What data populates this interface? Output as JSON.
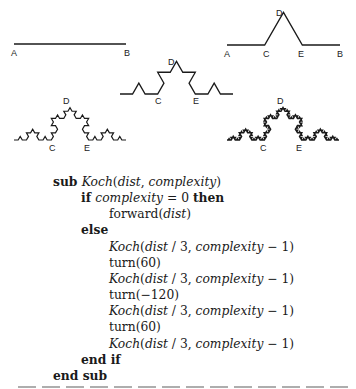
{
  "figures": [
    {
      "level": 0,
      "start": [
        14,
        44
      ],
      "end": [
        126,
        44
      ],
      "labels": [
        {
          "t": "A",
          "x": 11,
          "y": 56
        },
        {
          "t": "B",
          "x": 124,
          "y": 56
        }
      ]
    },
    {
      "level": 1,
      "start": [
        227,
        45
      ],
      "end": [
        340,
        45
      ],
      "labels": [
        {
          "t": "A",
          "x": 224,
          "y": 57
        },
        {
          "t": "C",
          "x": 263,
          "y": 57
        },
        {
          "t": "D",
          "x": 276,
          "y": 16
        },
        {
          "t": "E",
          "x": 298,
          "y": 57
        },
        {
          "t": "B",
          "x": 337,
          "y": 57
        }
      ]
    },
    {
      "level": 2,
      "start": [
        120,
        94
      ],
      "end": [
        233,
        94
      ],
      "labels": [
        {
          "t": "D",
          "x": 168,
          "y": 65
        },
        {
          "t": "C",
          "x": 155,
          "y": 104
        },
        {
          "t": "E",
          "x": 193,
          "y": 104
        }
      ]
    },
    {
      "level": 3,
      "start": [
        14,
        140
      ],
      "end": [
        126,
        140
      ],
      "labels": [
        {
          "t": "D",
          "x": 63,
          "y": 104
        },
        {
          "t": "C",
          "x": 49,
          "y": 151
        },
        {
          "t": "E",
          "x": 84,
          "y": 151
        }
      ]
    },
    {
      "level": 4,
      "start": [
        227,
        140
      ],
      "end": [
        339,
        140
      ],
      "labels": [
        {
          "t": "D",
          "x": 277,
          "y": 104
        },
        {
          "t": "C",
          "x": 260,
          "y": 151
        },
        {
          "t": "E",
          "x": 296,
          "y": 151
        }
      ]
    }
  ],
  "code": {
    "lines": [
      {
        "indent": 53,
        "parts": [
          {
            "k": "kw",
            "t": "sub "
          },
          {
            "k": "it",
            "t": "Koch"
          },
          {
            "k": "rm",
            "t": "("
          },
          {
            "k": "it",
            "t": "dist"
          },
          {
            "k": "rm",
            "t": ", "
          },
          {
            "k": "it",
            "t": "complexity"
          },
          {
            "k": "rm",
            "t": ")"
          }
        ]
      },
      {
        "indent": 81,
        "parts": [
          {
            "k": "kw",
            "t": "if "
          },
          {
            "k": "it",
            "t": "complexity"
          },
          {
            "k": "rm",
            "t": " = 0 "
          },
          {
            "k": "kw",
            "t": "then"
          }
        ]
      },
      {
        "indent": 109,
        "parts": [
          {
            "k": "rm",
            "t": "forward("
          },
          {
            "k": "it",
            "t": "dist"
          },
          {
            "k": "rm",
            "t": ")"
          }
        ]
      },
      {
        "indent": 81,
        "parts": [
          {
            "k": "kw",
            "t": "else"
          }
        ]
      },
      {
        "indent": 109,
        "parts": [
          {
            "k": "it",
            "t": "Koch"
          },
          {
            "k": "rm",
            "t": "("
          },
          {
            "k": "it",
            "t": "dist"
          },
          {
            "k": "rm",
            "t": " / 3, "
          },
          {
            "k": "it",
            "t": "complexity"
          },
          {
            "k": "rm",
            "t": " − 1)"
          }
        ]
      },
      {
        "indent": 109,
        "parts": [
          {
            "k": "rm",
            "t": "turn(60)"
          }
        ]
      },
      {
        "indent": 109,
        "parts": [
          {
            "k": "it",
            "t": "Koch"
          },
          {
            "k": "rm",
            "t": "("
          },
          {
            "k": "it",
            "t": "dist"
          },
          {
            "k": "rm",
            "t": " / 3, "
          },
          {
            "k": "it",
            "t": "complexity"
          },
          {
            "k": "rm",
            "t": " − 1)"
          }
        ]
      },
      {
        "indent": 109,
        "parts": [
          {
            "k": "rm",
            "t": "turn(−120)"
          }
        ]
      },
      {
        "indent": 109,
        "parts": [
          {
            "k": "it",
            "t": "Koch"
          },
          {
            "k": "rm",
            "t": "("
          },
          {
            "k": "it",
            "t": "dist"
          },
          {
            "k": "rm",
            "t": " / 3, "
          },
          {
            "k": "it",
            "t": "complexity"
          },
          {
            "k": "rm",
            "t": " − 1)"
          }
        ]
      },
      {
        "indent": 109,
        "parts": [
          {
            "k": "rm",
            "t": "turn(60)"
          }
        ]
      },
      {
        "indent": 109,
        "parts": [
          {
            "k": "it",
            "t": "Koch"
          },
          {
            "k": "rm",
            "t": "("
          },
          {
            "k": "it",
            "t": "dist"
          },
          {
            "k": "rm",
            "t": " / 3, "
          },
          {
            "k": "it",
            "t": "complexity"
          },
          {
            "k": "rm",
            "t": " − 1)"
          }
        ]
      },
      {
        "indent": 81,
        "parts": [
          {
            "k": "kw",
            "t": "end if"
          }
        ]
      },
      {
        "indent": 53,
        "parts": [
          {
            "k": "kw",
            "t": "end sub"
          }
        ]
      }
    ]
  }
}
